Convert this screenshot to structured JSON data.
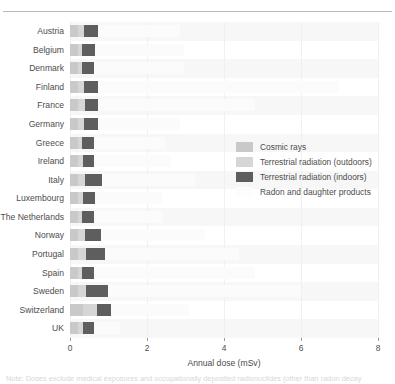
{
  "chart_data": {
    "type": "bar",
    "orientation": "horizontal",
    "stacked": true,
    "title": "",
    "xlabel": "Annual dose (mSv)",
    "ylabel": "",
    "xlim": [
      0,
      8
    ],
    "xticks": [
      0,
      2,
      4,
      6,
      8
    ],
    "xticklabels": [
      "0",
      "2",
      "4",
      "6",
      "8"
    ],
    "grid": false,
    "legend_position": "center-right",
    "categories": [
      "Austria",
      "Belgium",
      "Denmark",
      "Finland",
      "France",
      "Germany",
      "Greece",
      "Ireland",
      "Italy",
      "Luxembourg",
      "The Netherlands",
      "Norway",
      "Portugal",
      "Spain",
      "Sweden",
      "Switzerland",
      "UK"
    ],
    "series": [
      {
        "name": "Cosmic rays",
        "color": "#c9c9c9",
        "values": [
          0.22,
          0.22,
          0.22,
          0.22,
          0.22,
          0.22,
          0.22,
          0.22,
          0.22,
          0.22,
          0.22,
          0.22,
          0.22,
          0.22,
          0.22,
          0.35,
          0.22
        ]
      },
      {
        "name": "Terrestrial radiation (outdoors)",
        "color": "#d6d6d6",
        "values": [
          0.14,
          0.1,
          0.1,
          0.14,
          0.16,
          0.14,
          0.1,
          0.12,
          0.18,
          0.12,
          0.1,
          0.18,
          0.2,
          0.1,
          0.2,
          0.35,
          0.12
        ]
      },
      {
        "name": "Terrestrial radiation (indoors)",
        "color": "#5e5e5e",
        "values": [
          0.36,
          0.32,
          0.3,
          0.38,
          0.36,
          0.36,
          0.3,
          0.28,
          0.44,
          0.3,
          0.3,
          0.4,
          0.5,
          0.3,
          0.56,
          0.36,
          0.28
        ]
      },
      {
        "name": "Radon and daughter products",
        "color": "#fbfbfb",
        "values": [
          2.15,
          2.32,
          2.34,
          6.22,
          4.06,
          2.14,
          1.86,
          2.0,
          2.42,
          1.76,
          1.78,
          2.7,
          3.48,
          4.18,
          5.02,
          2.04,
          0.68
        ]
      }
    ],
    "totals": [
      2.87,
      2.96,
      2.96,
      6.96,
      4.8,
      2.86,
      2.48,
      2.62,
      3.26,
      2.4,
      2.4,
      3.5,
      4.4,
      4.8,
      6.0,
      3.1,
      1.3
    ]
  },
  "legend": {
    "items": [
      {
        "label": "Cosmic rays",
        "color": "#c9c9c9"
      },
      {
        "label": "Terrestrial radiation (outdoors)",
        "color": "#d6d6d6"
      },
      {
        "label": "Terrestrial radiation (indoors)",
        "color": "#5e5e5e"
      },
      {
        "label": "Radon and daughter products",
        "color": "#fdfdfd"
      }
    ]
  },
  "axis": {
    "title": "Annual dose (mSv)"
  },
  "footnote": {
    "text": "Note: Doses exclude medical exposures and occupationally deposited radionuclides (other than radon decay"
  }
}
